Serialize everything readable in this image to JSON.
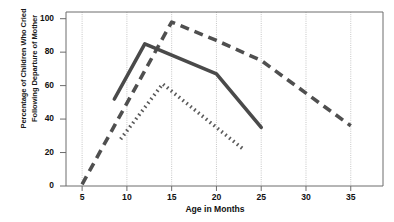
{
  "chart_data": {
    "type": "line",
    "title": "",
    "xlabel": "Age in Months",
    "ylabel_line1": "Percentage of Children Who Cried",
    "ylabel_line2": "Following Departure of Mother",
    "xlim": [
      3.2,
      38.6
    ],
    "ylim": [
      0,
      104
    ],
    "xticks": [
      5,
      10,
      15,
      20,
      25,
      30,
      35
    ],
    "yticks": [
      0,
      20,
      40,
      60,
      80,
      100
    ],
    "grid": "vertical-dotted",
    "legend": "none",
    "series": [
      {
        "name": "dashed-series",
        "style": "dashed",
        "color": "#4f4f4f",
        "points": [
          {
            "x": 5,
            "y": 1
          },
          {
            "x": 15,
            "y": 98
          },
          {
            "x": 20,
            "y": 87
          },
          {
            "x": 25,
            "y": 75
          },
          {
            "x": 35,
            "y": 36
          }
        ]
      },
      {
        "name": "solid-series",
        "style": "solid",
        "color": "#4a4a4a",
        "points": [
          {
            "x": 8.6,
            "y": 52
          },
          {
            "x": 12,
            "y": 85
          },
          {
            "x": 20,
            "y": 67
          },
          {
            "x": 25,
            "y": 35
          }
        ]
      },
      {
        "name": "dotted-series",
        "style": "dotted",
        "color": "#5a5a5a",
        "points": [
          {
            "x": 9.3,
            "y": 28
          },
          {
            "x": 14,
            "y": 61
          },
          {
            "x": 23,
            "y": 22
          }
        ]
      }
    ]
  },
  "ticks": {
    "y": [
      "100",
      "80",
      "60",
      "40",
      "20",
      "0"
    ],
    "x": [
      "5",
      "10",
      "15",
      "20",
      "25",
      "30",
      "35"
    ]
  },
  "axis": {
    "x_title": "Age in Months",
    "y_title_line1": "Percentage of Children Who Cried",
    "y_title_line2": "Following Departure of Mother"
  }
}
